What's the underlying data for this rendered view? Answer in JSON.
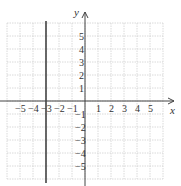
{
  "chart_data": {
    "type": "line",
    "title": "",
    "equation": "x = -3",
    "xlabel": "x",
    "ylabel": "y",
    "xlim": [
      -6,
      6
    ],
    "ylim": [
      -6,
      6
    ],
    "grid": true,
    "x_ticks": [
      -5,
      -4,
      -3,
      -2,
      -1,
      1,
      2,
      3,
      4,
      5
    ],
    "y_ticks": [
      5,
      4,
      3,
      2,
      1,
      -1,
      -2,
      -3,
      -4,
      -5
    ],
    "x_tick_labels": [
      "−5",
      "−4",
      "−3",
      "−2",
      "−1",
      "1",
      "2",
      "3",
      "4",
      "5"
    ],
    "y_tick_labels": [
      "5",
      "4",
      "3",
      "2",
      "1",
      "−1",
      "−2",
      "−3",
      "−4",
      "−5"
    ],
    "series": [
      {
        "name": "x = -3",
        "type": "vertical-line",
        "x": [
          -3,
          -3
        ],
        "y": [
          -6,
          6
        ]
      }
    ]
  },
  "colors": {
    "grid": "#d0d0d0",
    "axis": "#444444",
    "line": "#444444"
  }
}
